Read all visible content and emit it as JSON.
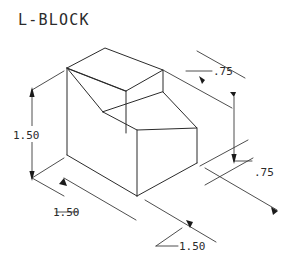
{
  "drawing": {
    "title": "L-BLOCK",
    "background_color": "#ffffff",
    "line_color": "#2b2b2b",
    "dimension_color": "#3a3a3a",
    "projection": "isometric",
    "object_name": "L-shaped block"
  },
  "dimensions": [
    {
      "id": "height-left",
      "label": "1.50",
      "position": "left",
      "describes": "overall height of left vertical face"
    },
    {
      "id": "depth-front-left",
      "label": "1.50",
      "position": "lower-left",
      "describes": "depth along lower-left isometric axis"
    },
    {
      "id": "step-top-right",
      "label": ".75",
      "position": "upper-right",
      "describes": "width of upper step"
    },
    {
      "id": "step-height-right",
      "label": ".75",
      "position": "right",
      "describes": "height of lower step block"
    },
    {
      "id": "width-bottom",
      "label": "1.50",
      "position": "bottom",
      "describes": "overall width along lower-right isometric axis"
    }
  ],
  "geometry": {
    "vertices": {
      "top_left": "67,68",
      "top_rear": "105,48",
      "top_right_rear": "163,70",
      "top_front_mid": "126,91",
      "step_left": "103,112",
      "step_front": "137,130",
      "step_right": "197,128",
      "left_bottom": "67,155",
      "bottom_apex": "137,196",
      "right_bottom": "197,163"
    }
  }
}
